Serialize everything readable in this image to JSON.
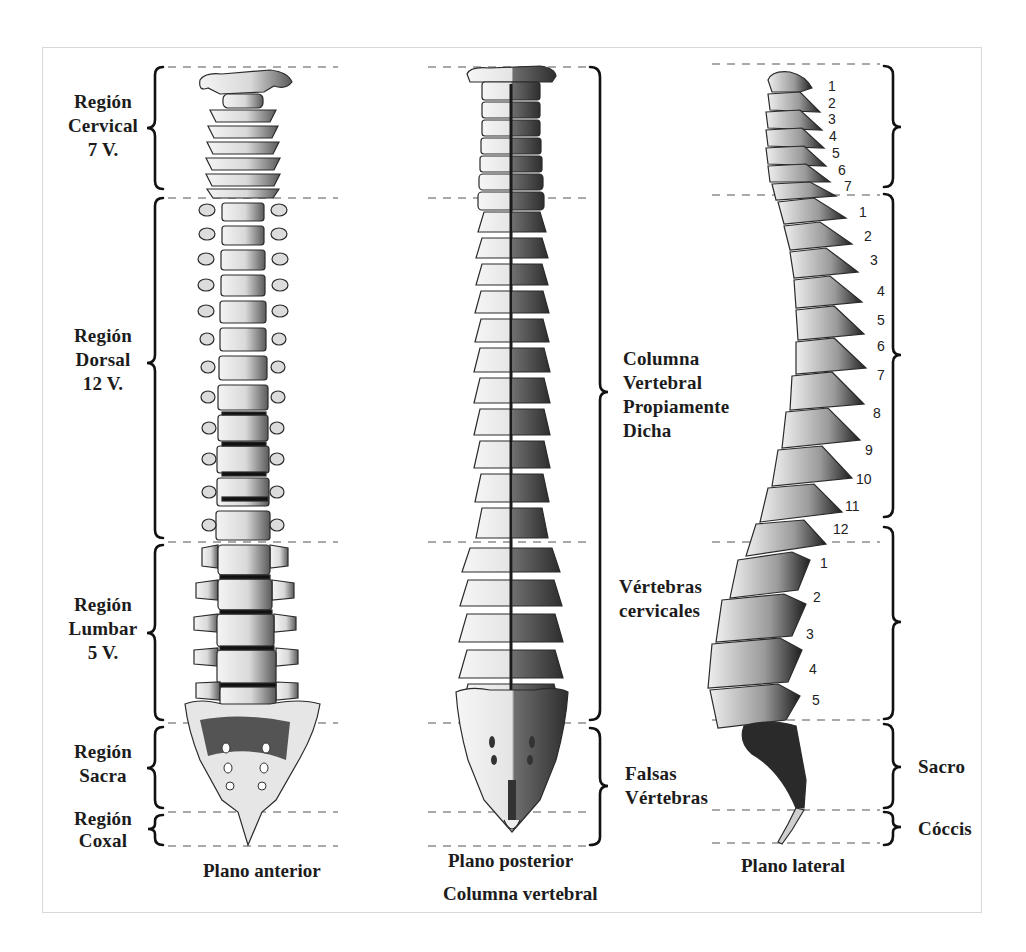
{
  "figure": {
    "title": "Columna vertebral",
    "views": [
      {
        "id": "anterior",
        "caption": "Plano anterior"
      },
      {
        "id": "posterior",
        "caption": "Plano posterior"
      },
      {
        "id": "lateral",
        "caption": "Plano lateral"
      }
    ]
  },
  "left_labels": {
    "cervical": [
      "Región",
      "Cervical",
      "7 V."
    ],
    "dorsal": [
      "Región",
      "Dorsal",
      "12 V."
    ],
    "lumbar": [
      "Región",
      "Lumbar",
      "5 V."
    ],
    "sacra": [
      "Región",
      "Sacra"
    ],
    "coxal": [
      "Región",
      "Coxal"
    ]
  },
  "middle_labels": {
    "columna_propia": [
      "Columna",
      "Vertebral",
      "Propiamente",
      "Dicha"
    ],
    "vertebras_cervicales": [
      "Vértebras",
      "cervicales"
    ],
    "falsas": [
      "Falsas",
      "Vértebras"
    ]
  },
  "right_labels": {
    "sacro": "Sacro",
    "coccis": "Cóccis"
  },
  "lateral_numbers": {
    "cervical": [
      "1",
      "2",
      "3",
      "4",
      "5",
      "6",
      "7"
    ],
    "dorsal": [
      "1",
      "2",
      "3",
      "4",
      "5",
      "6",
      "7",
      "8",
      "9",
      "10",
      "11",
      "12"
    ],
    "lumbar": [
      "1",
      "2",
      "3",
      "4",
      "5"
    ]
  }
}
